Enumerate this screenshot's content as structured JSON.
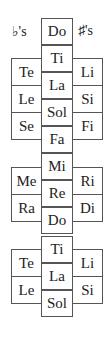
{
  "headers": {
    "flats": "♭'s",
    "sharps": "♯'s"
  },
  "center": [
    {
      "label": "Do",
      "top": 18
    },
    {
      "label": "Ti",
      "top": 45
    },
    {
      "label": "La",
      "top": 72
    },
    {
      "label": "Sol",
      "top": 99
    },
    {
      "label": "Fa",
      "top": 126
    },
    {
      "label": "Mi",
      "top": 153
    },
    {
      "label": "Re",
      "top": 180
    },
    {
      "label": "Do",
      "top": 207
    },
    {
      "label": "Ti",
      "top": 236
    },
    {
      "label": "La",
      "top": 263
    },
    {
      "label": "Sol",
      "top": 290
    }
  ],
  "left": [
    {
      "label": "Te",
      "top": 58
    },
    {
      "label": "Le",
      "top": 85
    },
    {
      "label": "Se",
      "top": 112
    },
    {
      "label": "Me",
      "top": 167
    },
    {
      "label": "Ra",
      "top": 194
    },
    {
      "label": "Te",
      "top": 249
    },
    {
      "label": "Le",
      "top": 276
    }
  ],
  "right": [
    {
      "label": "Li",
      "top": 58
    },
    {
      "label": "Si",
      "top": 85
    },
    {
      "label": "Fi",
      "top": 112
    },
    {
      "label": "Ri",
      "top": 167
    },
    {
      "label": "Di",
      "top": 194
    },
    {
      "label": "Li",
      "top": 249
    },
    {
      "label": "Si",
      "top": 276
    }
  ]
}
